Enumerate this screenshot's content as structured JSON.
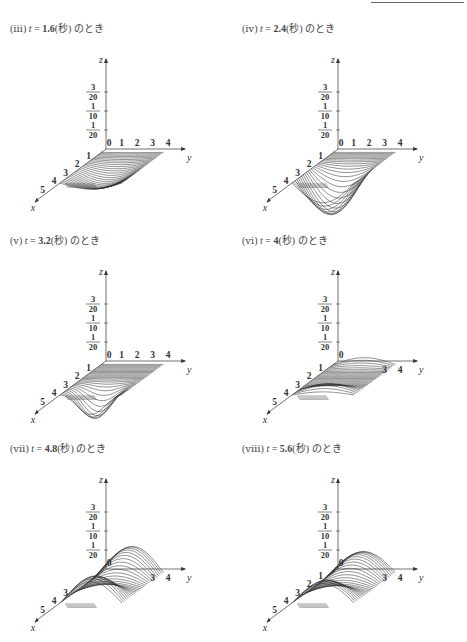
{
  "header_rule": true,
  "panels": [
    {
      "id": "iii",
      "caption": {
        "label": "(ⅲ)",
        "var": "t",
        "eq": "=",
        "value": "1.6",
        "unit": "(秒)",
        "suffix": "のとき"
      }
    },
    {
      "id": "iv",
      "caption": {
        "label": "(ⅳ)",
        "var": "t",
        "eq": "=",
        "value": "2.4",
        "unit": "(秒)",
        "suffix": "のとき"
      }
    },
    {
      "id": "v",
      "caption": {
        "label": "(ⅴ)",
        "var": "t",
        "eq": "=",
        "value": "3.2",
        "unit": "(秒)",
        "suffix": "のとき"
      }
    },
    {
      "id": "vi",
      "caption": {
        "label": "(ⅵ)",
        "var": "t",
        "eq": "=",
        "value": "4",
        "unit": "(秒)",
        "suffix": "のとき"
      }
    },
    {
      "id": "vii",
      "caption": {
        "label": "(ⅶ)",
        "var": "t",
        "eq": "=",
        "value": "4.8",
        "unit": "(秒)",
        "suffix": "のとき"
      }
    },
    {
      "id": "viii",
      "caption": {
        "label": "(ⅷ)",
        "var": "t",
        "eq": "=",
        "value": "5.6",
        "unit": "(秒)",
        "suffix": "のとき"
      }
    }
  ],
  "axes": {
    "z_label": "z",
    "y_label": "y",
    "x_label": "x",
    "z_ticks": [
      {
        "num": "3",
        "den": "20"
      },
      {
        "num": "1",
        "den": "10"
      },
      {
        "num": "1",
        "den": "20"
      }
    ],
    "y_ticks": [
      "0",
      "1",
      "2",
      "3",
      "4"
    ],
    "x_ticks": [
      "1",
      "2",
      "3",
      "4",
      "5"
    ]
  },
  "chart_data": [
    {
      "type": "surface",
      "title": "t = 1.6 (秒) のとき",
      "xlabel": "x",
      "ylabel": "y",
      "zlabel": "z",
      "x_range": [
        0,
        5
      ],
      "y_range": [
        0,
        4
      ],
      "z_ticks": [
        0.05,
        0.1,
        0.15
      ],
      "shape": "shallow trough, negative dip near x≈3, y≈2"
    },
    {
      "type": "surface",
      "title": "t = 2.4 (秒) のとき",
      "xlabel": "x",
      "ylabel": "y",
      "zlabel": "z",
      "x_range": [
        0,
        5
      ],
      "y_range": [
        0,
        4
      ],
      "z_ticks": [
        0.05,
        0.1,
        0.15
      ],
      "shape": "deep trough, min ≈ -0.1 near x≈3, y≈2"
    },
    {
      "type": "surface",
      "title": "t = 3.2 (秒) のとき",
      "xlabel": "x",
      "ylabel": "y",
      "zlabel": "z",
      "x_range": [
        0,
        5
      ],
      "y_range": [
        0,
        4
      ],
      "z_ticks": [
        0.05,
        0.1,
        0.15
      ],
      "shape": "narrow trough moving toward front"
    },
    {
      "type": "surface",
      "title": "t = 4 (秒) のとき",
      "xlabel": "x",
      "ylabel": "y",
      "zlabel": "z",
      "x_range": [
        0,
        5
      ],
      "y_range": [
        0,
        4
      ],
      "z_ticks": [
        0.05,
        0.1,
        0.15
      ],
      "shape": "nearly flat, small ridges at back and front edges"
    },
    {
      "type": "surface",
      "title": "t = 4.8 (秒) のとき",
      "xlabel": "x",
      "ylabel": "y",
      "zlabel": "z",
      "x_range": [
        0,
        5
      ],
      "y_range": [
        0,
        4
      ],
      "z_ticks": [
        0.05,
        0.1,
        0.15
      ],
      "shape": "positive hump, max ≈ 0.07 near y≈1.5"
    },
    {
      "type": "surface",
      "title": "t = 5.6 (秒) のとき",
      "xlabel": "x",
      "ylabel": "y",
      "zlabel": "z",
      "x_range": [
        0,
        5
      ],
      "y_range": [
        0,
        4
      ],
      "z_ticks": [
        0.05,
        0.1,
        0.15
      ],
      "shape": "positive hump, max ≈ 0.06 near y≈2"
    }
  ]
}
